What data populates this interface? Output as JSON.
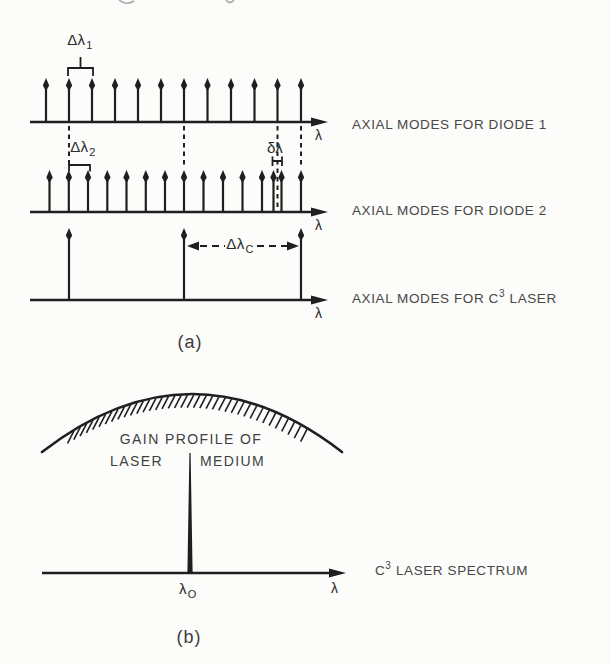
{
  "colors": {
    "ink": "#1f1f1f",
    "text": "#474747",
    "background": "#fcfcfa",
    "artifact": "#8f8f8f"
  },
  "panel_a": {
    "caption": "(a)",
    "rows": [
      {
        "label": "AXIAL MODES FOR DIODE 1",
        "axis_symbol": "λ"
      },
      {
        "label": "AXIAL MODES FOR DIODE 2",
        "axis_symbol": "λ"
      },
      {
        "label_pre": "AXIAL MODES FOR C",
        "label_sup": "3",
        "label_post": "LASER",
        "axis_symbol": "λ"
      }
    ],
    "annotations": {
      "d1": {
        "base": "Δλ",
        "sub": "1"
      },
      "d2": {
        "base": "Δλ",
        "sub": "2"
      },
      "small_delta": "δλ",
      "dc": {
        "base": "Δλ",
        "sub": "C"
      }
    }
  },
  "panel_b": {
    "caption": "(b)",
    "gain_line1": "GAIN PROFILE OF",
    "gain_line2_left": "LASER",
    "gain_line2_right": "MEDIUM",
    "spectrum_pre": "C",
    "spectrum_sup": "3",
    "spectrum_post": "LASER SPECTRUM",
    "lambda0": {
      "base": "λ",
      "sub": "O"
    },
    "axis_symbol": "λ"
  },
  "diagram_data": {
    "axes": [
      {
        "name": "diode1-axis",
        "y": 122,
        "x1": 30,
        "x2": 328,
        "mode_height": 44,
        "modes": [
          46,
          69,
          92,
          115,
          138,
          161,
          184,
          207.5,
          231,
          254.5,
          277.5,
          301
        ]
      },
      {
        "name": "diode2-axis",
        "y": 212,
        "x1": 30,
        "x2": 328,
        "mode_height": 42,
        "modes": [
          49.5,
          68.8,
          88,
          107.3,
          126.5,
          145.8,
          165,
          184,
          203.5,
          223,
          242.5,
          262,
          273.5,
          281.5,
          301
        ]
      },
      {
        "name": "c3-axis",
        "y": 300,
        "x1": 30,
        "x2": 328,
        "mode_height": 72,
        "modes": [
          69,
          184,
          301
        ]
      }
    ],
    "dashed_verticals": [
      {
        "x": 69,
        "y1": 126,
        "y2": 166
      },
      {
        "x": 184,
        "y1": 126,
        "y2": 167
      },
      {
        "x": 277.5,
        "y1": 126,
        "y2": 209
      },
      {
        "x": 301,
        "y1": 126,
        "y2": 166
      }
    ],
    "bracket_paths": [
      "M68,76 L68,68 L93,68 L93,76 M80.5,68 L80.5,57",
      "M69,171.5 L69,165 L90,165 L90,171.5",
      "M272.5,156.5 L272.5,166 M272.5,161 L282,161 M282,156.5 L282,166"
    ],
    "delta_c": {
      "y": 246,
      "left_tip": 187,
      "right_tip": 299,
      "seg1": [
        200,
        225
      ],
      "seg2": [
        257,
        287
      ],
      "head_len": 12,
      "head_h": 4.5
    },
    "gain_arc": "M42,452 Q192,336 342,452",
    "hatch": {
      "x1": 74,
      "x2": 311,
      "step": 6.3,
      "dx": -6.5,
      "dy": 13.5,
      "arc": {
        "x0": 42,
        "span": 300,
        "ybase": 452,
        "depth": 232
      }
    },
    "spike": "187.4,572.5 189.4,453 190.6,453 192.6,572.5",
    "axis_b": {
      "y": 573,
      "x1": 42,
      "x2": 346
    },
    "artifacts": [
      "M119,0 Q126,6 134,1",
      "M226,0 Q230,5 234,0"
    ]
  }
}
